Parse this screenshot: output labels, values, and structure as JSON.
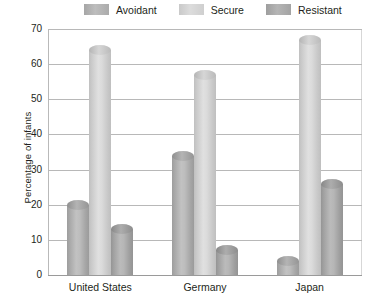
{
  "chart_data": {
    "type": "bar",
    "title": "",
    "xlabel": "",
    "ylabel": "Percentage of infants",
    "categories": [
      "United States",
      "Germany",
      "Japan"
    ],
    "series": [
      {
        "name": "Avoidant",
        "values": [
          20,
          34,
          4
        ],
        "color": "#b3b3b3"
      },
      {
        "name": "Secure",
        "values": [
          64,
          57,
          67
        ],
        "color": "#d4d4d4"
      },
      {
        "name": "Resistant",
        "values": [
          13,
          7,
          26
        ],
        "color": "#ababab"
      }
    ],
    "ylim": [
      0,
      70
    ],
    "yticks": [
      0,
      10,
      20,
      30,
      40,
      50,
      60,
      70
    ],
    "ytick_labels": [
      "0",
      "10",
      "20",
      "30",
      "40",
      "50",
      "60",
      "70"
    ],
    "grid": true,
    "legend_position": "top"
  },
  "legend": {
    "items": [
      {
        "label": "Avoidant"
      },
      {
        "label": "Secure"
      },
      {
        "label": "Resistant"
      }
    ]
  },
  "axes": {
    "y_title": "Percentage of infants",
    "y_ticks": [
      "70",
      "60",
      "50",
      "40",
      "30",
      "20",
      "10",
      "0"
    ],
    "x_ticks": [
      "United States",
      "Germany",
      "Japan"
    ]
  }
}
